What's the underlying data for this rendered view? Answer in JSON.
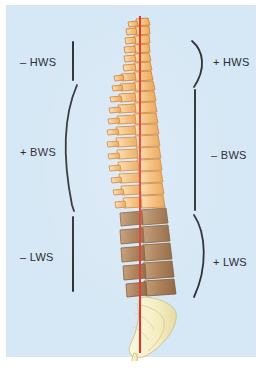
{
  "figure": {
    "type": "anatomical-diagram",
    "background_color": "#d6e7f5",
    "plumb_line_color": "#e0322a"
  },
  "labels": {
    "left": [
      {
        "id": "minus-hws",
        "text": "– HWS",
        "x": 14,
        "y": 51,
        "marker": "straight-line"
      },
      {
        "id": "plus-bws",
        "text": "+ BWS",
        "x": 14,
        "y": 141,
        "marker": "curly-bracket-left"
      },
      {
        "id": "minus-lws",
        "text": "– LWS",
        "x": 14,
        "y": 246,
        "marker": "straight-line"
      }
    ],
    "right": [
      {
        "id": "plus-hws",
        "text": "+ HWS",
        "x": 214,
        "y": 51,
        "marker": "curly-bracket-right"
      },
      {
        "id": "minus-bws",
        "text": "– BWS",
        "x": 214,
        "y": 144,
        "marker": "straight-line"
      },
      {
        "id": "plus-lws",
        "text": "+ LWS",
        "x": 214,
        "y": 251,
        "marker": "curly-bracket-right"
      }
    ]
  },
  "spine_regions": [
    {
      "id": "cervical",
      "abbrev": "HWS",
      "color": "#f4b96b",
      "vertebrae": 7
    },
    {
      "id": "thoracic",
      "abbrev": "BWS",
      "color": "#f1b36a",
      "vertebrae": 12
    },
    {
      "id": "lumbar",
      "abbrev": "LWS",
      "color": "#a97c52",
      "vertebrae": 5
    },
    {
      "id": "sacrum-coccyx",
      "abbrev": "",
      "color": "#f7f0c8",
      "vertebrae": 1
    }
  ],
  "colors": {
    "panel": "#d6e7f5",
    "marker": "#2e2e36",
    "text": "#2b2b33",
    "cervical": "#f4b96b",
    "thoracic": "#f1b36a",
    "lumbar": "#a97c52",
    "sacrum": "#f7f0c8",
    "outline": "#c9762c",
    "plumb": "#e0322a"
  }
}
